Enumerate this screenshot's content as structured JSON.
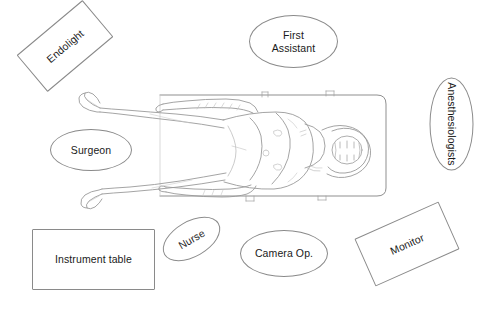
{
  "diagram": {
    "background_color": "#ffffff",
    "stroke_color": "#8a8a8a",
    "text_color": "#1a1a1a",
    "width": 487,
    "height": 316,
    "center_illustration": "supine-patient-on-operating-table",
    "nodes": [
      {
        "id": "endolight",
        "label": "Endolight",
        "shape": "rect",
        "rotation": -40,
        "x": 22,
        "y": 22,
        "w": 86,
        "h": 48
      },
      {
        "id": "first-assistant",
        "label": "First\nAssistant",
        "shape": "ellipse",
        "rotation": 0,
        "x": 249,
        "y": 15,
        "w": 89,
        "h": 53
      },
      {
        "id": "anesthesiologists",
        "label": "Anesthesiologists",
        "shape": "ellipse",
        "rotation": 90,
        "x": 405,
        "y": 102,
        "w": 93,
        "h": 44
      },
      {
        "id": "surgeon",
        "label": "Surgeon",
        "shape": "ellipse",
        "rotation": 0,
        "x": 50,
        "y": 129,
        "w": 82,
        "h": 42
      },
      {
        "id": "nurse",
        "label": "Nurse",
        "shape": "ellipse",
        "rotation": -30,
        "x": 160,
        "y": 221,
        "w": 63,
        "h": 36
      },
      {
        "id": "camera-op",
        "label": "Camera Op.",
        "shape": "ellipse",
        "rotation": 0,
        "x": 240,
        "y": 230,
        "w": 88,
        "h": 47
      },
      {
        "id": "instrument-table",
        "label": "Instrument table",
        "shape": "rect",
        "rotation": 0,
        "x": 32,
        "y": 229,
        "w": 123,
        "h": 61
      },
      {
        "id": "monitor",
        "label": "Monitor",
        "shape": "rect",
        "rotation": -24,
        "x": 361,
        "y": 218,
        "w": 92,
        "h": 52
      }
    ]
  }
}
